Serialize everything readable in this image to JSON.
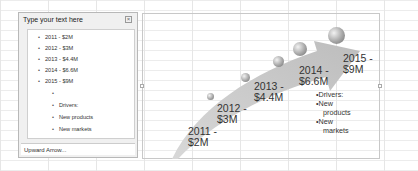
{
  "text_pane": {
    "title": "Type your text here",
    "close_icon": "close-icon",
    "items": [
      {
        "label": "2011 - $2M",
        "level": 1
      },
      {
        "label": "2012 - $3M",
        "level": 1
      },
      {
        "label": "2013 - $4.4M",
        "level": 1
      },
      {
        "label": "2014 - $6.6M",
        "level": 1
      },
      {
        "label": "2015 - $9M",
        "level": 1
      },
      {
        "label": "",
        "level": 2
      },
      {
        "label": "Drivers:",
        "level": 2
      },
      {
        "label": "New products",
        "level": 2
      },
      {
        "label": "New markets",
        "level": 2
      }
    ],
    "footer": "Upward Arrow..."
  },
  "smartart": {
    "type": "Upward Arrow",
    "milestones": [
      {
        "year": "2011 -",
        "value": "$2M"
      },
      {
        "year": "2012 -",
        "value": "$3M"
      },
      {
        "year": "2013 -",
        "value": "$4.4M"
      },
      {
        "year": "2014 -",
        "value": "$6.6M"
      },
      {
        "year": "2015 -",
        "value": "$9M"
      }
    ],
    "drivers": {
      "heading": "Drivers:",
      "items": [
        {
          "line1": "New",
          "line2": "products"
        },
        {
          "line1": "New",
          "line2": "markets"
        }
      ]
    },
    "colors": {
      "arrow": "#c8c8c8",
      "orb": "#8c8c8c",
      "text": "#333333"
    }
  }
}
